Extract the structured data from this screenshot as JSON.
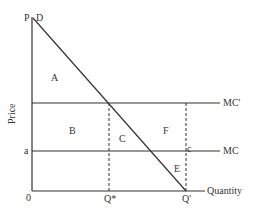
{
  "diagram": {
    "axes": {
      "ylabel": "Price",
      "xlabel": "Quantity",
      "origin": "0"
    },
    "curves": {
      "demand": "D",
      "mc": "MC",
      "mc_prime": "MC'"
    },
    "points": {
      "price_intercept": "P",
      "price_a": "a",
      "q_star": "Q*",
      "q_prime": "Q'",
      "c": "c"
    },
    "areas": {
      "A": "A",
      "B": "B",
      "C": "C",
      "E": "E",
      "F": "F"
    }
  }
}
